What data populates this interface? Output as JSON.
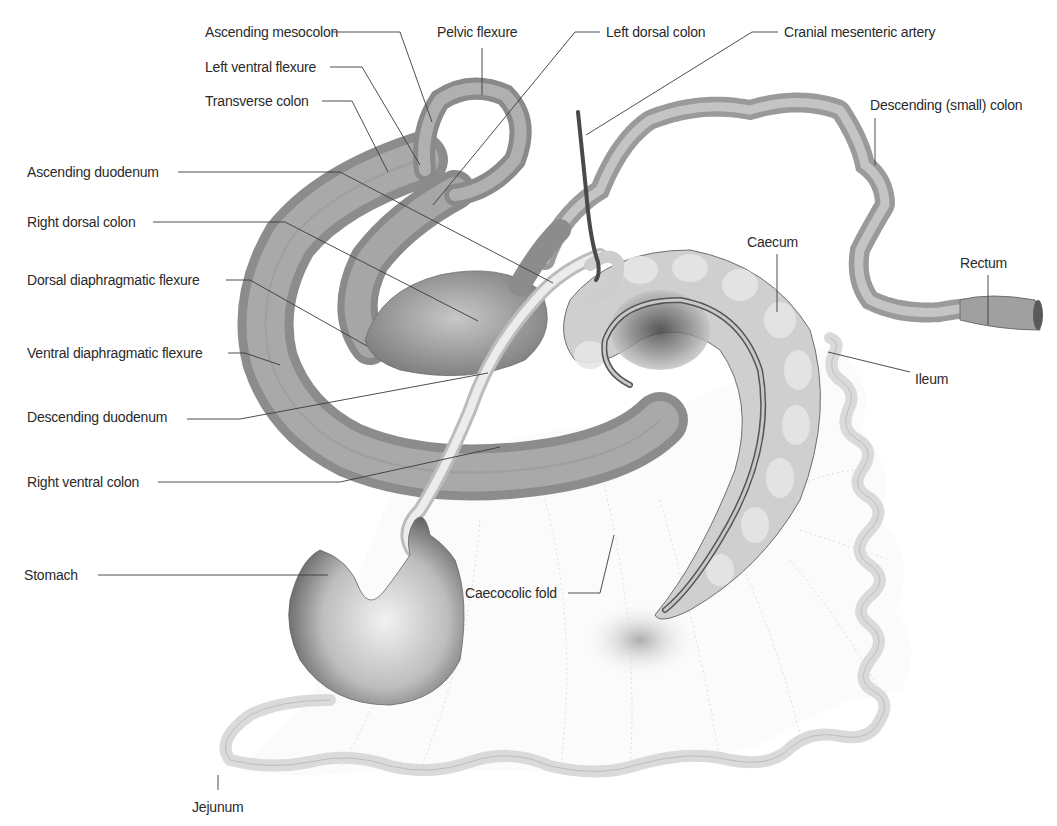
{
  "diagram": {
    "colors": {
      "organ_dark": "#7a7a7a",
      "organ_mid": "#a8a8a8",
      "organ_light": "#dcdcdc",
      "intestine_light": "#d8d8d8",
      "artery": "#4a4a4a",
      "leader": "#3a3a3a",
      "text": "#2a2a2a"
    },
    "labels": [
      {
        "id": "ascending-mesocolon",
        "text": "Ascending mesocolon",
        "x": 205,
        "y": 24,
        "line": "M 333 32 L 400 32 L 432 122"
      },
      {
        "id": "pelvic-flexure",
        "text": "Pelvic flexure",
        "x": 437,
        "y": 24,
        "line": "M 482 48 L 482 95"
      },
      {
        "id": "left-dorsal-colon",
        "text": "Left dorsal colon",
        "x": 606,
        "y": 24,
        "line": "M 600 32 L 575 32 L 433 205"
      },
      {
        "id": "cranial-mesenteric-artery",
        "text": "Cranial mesenteric artery",
        "x": 784,
        "y": 24,
        "line": "M 778 32 L 752 32 L 586 135"
      },
      {
        "id": "left-ventral-flexure",
        "text": "Left ventral flexure",
        "x": 205,
        "y": 59,
        "line": "M 330 67 L 362 67 L 420 165"
      },
      {
        "id": "transverse-colon",
        "text": "Transverse colon",
        "x": 205,
        "y": 93,
        "line": "M 322 101 L 352 101 L 388 172"
      },
      {
        "id": "descending-small-colon",
        "text": "Descending (small) colon",
        "x": 870,
        "y": 97,
        "line": "M 875 118 L 875 165"
      },
      {
        "id": "ascending-duodenum",
        "text": "Ascending duodenum",
        "x": 27,
        "y": 164,
        "line": "M 178 172 L 340 172 L 553 283"
      },
      {
        "id": "right-dorsal-colon",
        "text": "Right dorsal colon",
        "x": 27,
        "y": 214,
        "line": "M 153 222 L 285 222 L 478 321"
      },
      {
        "id": "caecum",
        "text": "Caecum",
        "x": 747,
        "y": 234,
        "line": "M 777 254 L 777 312"
      },
      {
        "id": "rectum",
        "text": "Rectum",
        "x": 960,
        "y": 255,
        "line": "M 988 275 L 988 325"
      },
      {
        "id": "dorsal-diaphragmatic-flexure",
        "text": "Dorsal diaphragmatic flexure",
        "x": 27,
        "y": 272,
        "line": "M 226 280 L 250 280 L 367 346"
      },
      {
        "id": "ventral-diaphragmatic-flexure",
        "text": "Ventral diaphragmatic flexure",
        "x": 27,
        "y": 345,
        "line": "M 228 353 L 245 353 L 280 365"
      },
      {
        "id": "ileum",
        "text": "Ileum",
        "x": 915,
        "y": 371,
        "line": "M 910 372 L 828 352"
      },
      {
        "id": "descending-duodenum",
        "text": "Descending duodenum",
        "x": 27,
        "y": 409,
        "line": "M 187 419 L 240 419 L 488 373"
      },
      {
        "id": "right-ventral-colon",
        "text": "Right ventral colon",
        "x": 27,
        "y": 474,
        "line": "M 158 482 L 340 482 L 500 447"
      },
      {
        "id": "stomach",
        "text": "Stomach",
        "x": 24,
        "y": 567,
        "line": "M 98 575 L 328 575"
      },
      {
        "id": "caecocolic-fold",
        "text": "Caecocolic fold",
        "x": 465,
        "y": 585,
        "line": "M 568 593 L 600 593 L 614 535"
      },
      {
        "id": "jejunum",
        "text": "Jejunum",
        "x": 192,
        "y": 799,
        "line": "M 218 790 L 218 775"
      }
    ]
  }
}
